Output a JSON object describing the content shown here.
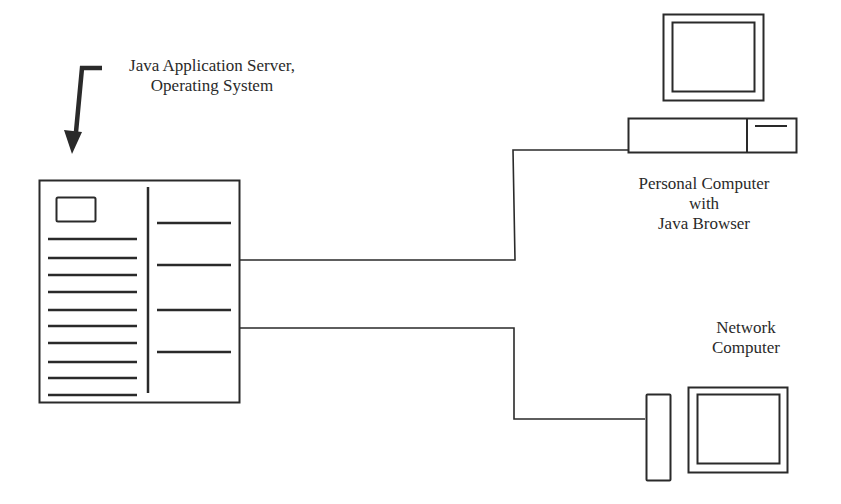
{
  "diagram": {
    "server": {
      "label_lines": [
        "Java Application Server,",
        "Operating System"
      ]
    },
    "personal_computer": {
      "label_lines": [
        "Personal Computer",
        "with",
        "Java Browser"
      ]
    },
    "network_computer": {
      "label_lines": [
        "Network",
        "Computer"
      ]
    },
    "colors": {
      "stroke": "#2a2a2a",
      "background": "#ffffff"
    }
  }
}
